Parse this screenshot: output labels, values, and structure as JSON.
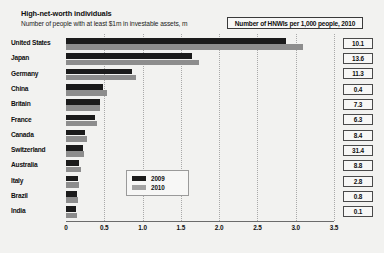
{
  "header": {
    "title": "High-net-worth individuals",
    "subtitle": "Number of people with at least $1m in investable assets, m",
    "right_box_label": "Number of HNWIs per 1,000 people, 2010"
  },
  "legend": {
    "items": [
      {
        "label": "2009",
        "color": "#1b1b1b"
      },
      {
        "label": "2010",
        "color": "#a2a2a2"
      }
    ]
  },
  "colors": {
    "background": "#f2f2f0",
    "series_2009": "#1b1b1b",
    "series_2010": "#8d8d8d",
    "gridline": "#a9a9a9",
    "axis": "#6b6b6b",
    "text": "#0f0f0f"
  },
  "chart_data": {
    "type": "bar",
    "title": "High-net-worth individuals",
    "subtitle": "Number of people with at least $1m in investable assets, m",
    "xlabel": "",
    "ylabel": "",
    "orientation": "horizontal",
    "xlim": [
      0,
      3.5
    ],
    "grid": true,
    "legend_position": "inside-center",
    "tick_labels": [
      "0",
      "0.5",
      "1.0",
      "1.5",
      "2.0",
      "2.5",
      "3.0",
      "3.5"
    ],
    "tick_values": [
      0,
      0.5,
      1.0,
      1.5,
      2.0,
      2.5,
      3.0,
      3.5
    ],
    "categories": [
      "United States",
      "Japan",
      "Germany",
      "China",
      "Britain",
      "France",
      "Canada",
      "Switzerland",
      "Australia",
      "Italy",
      "Brazil",
      "India"
    ],
    "series": [
      {
        "name": "2009",
        "values": [
          2.87,
          1.65,
          0.86,
          0.48,
          0.45,
          0.38,
          0.25,
          0.22,
          0.17,
          0.16,
          0.14,
          0.13
        ]
      },
      {
        "name": "2010",
        "values": [
          3.1,
          1.74,
          0.92,
          0.54,
          0.45,
          0.4,
          0.28,
          0.24,
          0.19,
          0.17,
          0.16,
          0.15
        ]
      }
    ],
    "annotation_column": {
      "header": "Number of HNWIs per 1,000 people, 2010",
      "values": [
        "10.1",
        "13.6",
        "11.3",
        "0.4",
        "7.3",
        "6.3",
        "8.4",
        "31.4",
        "8.8",
        "2.8",
        "0.8",
        "0.1"
      ]
    }
  }
}
